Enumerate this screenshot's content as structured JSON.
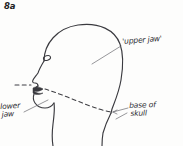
{
  "figure": {
    "number": "8a",
    "background_color": "#fdfdfc",
    "ink_color": "#3a3a3f"
  },
  "labels": {
    "upper_jaw": "'upper jaw'",
    "lower_jaw_line1": "lower",
    "lower_jaw_line2": "jaw",
    "base_of_skull_line1": "base of",
    "base_of_skull_line2": "skull"
  },
  "annotations": {
    "dashed_line_meaning": "plane separating upper jaw from lower jaw",
    "leader_upper_jaw": "points from label down-left into cranium",
    "leader_lower_jaw": "points from label up-right to mandible",
    "leader_base_of_skull": "arrow points left to occiput/neck junction"
  },
  "drawing_elements": {
    "head_outline": "profile contour: cranium, forehead, nose, lips, chin",
    "eye": "small oval",
    "nose": "angular profile line",
    "lips": "filled dark stroke",
    "neck_front": "curve descending from chin",
    "neck_back": "curve descending from occiput",
    "dashed_plane": "dashed curve from left edge through mouth to back of skull"
  }
}
